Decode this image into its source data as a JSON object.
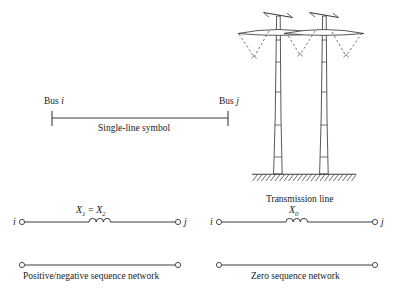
{
  "figure": {
    "single_line": {
      "bus_i_label": "Bus i",
      "bus_j_label": "Bus j",
      "caption": "Single-line symbol"
    },
    "tower": {
      "caption": "Transmission line"
    },
    "positive_negative_network": {
      "terminal_left": "i",
      "terminal_right": "j",
      "reactance_label": "X1 = X2",
      "reactance_symbol": "X",
      "reactance_sub_1": "1",
      "reactance_equals": " = ",
      "reactance_sub_2": "2",
      "caption": "Positive/negative sequence network"
    },
    "zero_network": {
      "terminal_left": "i",
      "terminal_right": "j",
      "reactance_label": "X0",
      "reactance_symbol": "X",
      "reactance_sub_0": "0",
      "caption": "Zero sequence network"
    }
  },
  "colors": {
    "line": "#3a3a3a",
    "text": "#1a1a1a",
    "background": "#ffffff",
    "dashed": "#555555"
  }
}
